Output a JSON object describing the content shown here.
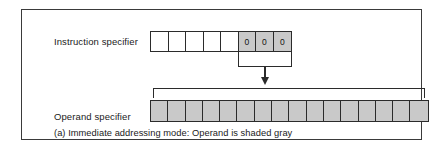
{
  "figure": {
    "caption": "(a) Immediate addressing mode: Operand is shaded gray",
    "colors": {
      "shaded_cell": "#c9c9c9",
      "empty_cell": "#ffffff",
      "line": "#2b2b2b",
      "frame": "#3a3a3a",
      "background": "#ffffff",
      "text": "#1a1a1a"
    },
    "rows": [
      {
        "id": "instruction-specifier",
        "label": "Instruction specifier",
        "cell_count": 8,
        "cells": [
          {
            "value": "",
            "shaded": false
          },
          {
            "value": "",
            "shaded": false
          },
          {
            "value": "",
            "shaded": false
          },
          {
            "value": "",
            "shaded": false
          },
          {
            "value": "",
            "shaded": false
          },
          {
            "value": "0",
            "shaded": true
          },
          {
            "value": "0",
            "shaded": true
          },
          {
            "value": "0",
            "shaded": true
          }
        ]
      },
      {
        "id": "operand-specifier",
        "label": "Operand specifier",
        "cell_count": 16,
        "cells": [
          {
            "value": "",
            "shaded": true
          },
          {
            "value": "",
            "shaded": true
          },
          {
            "value": "",
            "shaded": true
          },
          {
            "value": "",
            "shaded": true
          },
          {
            "value": "",
            "shaded": true
          },
          {
            "value": "",
            "shaded": true
          },
          {
            "value": "",
            "shaded": true
          },
          {
            "value": "",
            "shaded": true
          },
          {
            "value": "",
            "shaded": true
          },
          {
            "value": "",
            "shaded": true
          },
          {
            "value": "",
            "shaded": true
          },
          {
            "value": "",
            "shaded": true
          },
          {
            "value": "",
            "shaded": true
          },
          {
            "value": "",
            "shaded": true
          },
          {
            "value": "",
            "shaded": true
          },
          {
            "value": "",
            "shaded": true
          }
        ]
      }
    ],
    "connectors": [
      {
        "id": "addressing-mode-bracket",
        "type": "bracket-down",
        "spans_cells": "instruction-specifier bits 6-8"
      },
      {
        "id": "mode-to-operand-arrow",
        "type": "arrow-down",
        "direction": "down"
      },
      {
        "id": "operand-span-bracket",
        "type": "bracket-up",
        "spans_cells": "operand-specifier all 16 bits"
      }
    ]
  }
}
